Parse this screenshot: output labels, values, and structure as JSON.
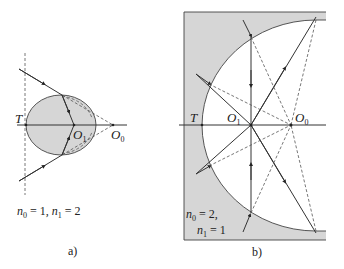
{
  "figure": {
    "panel_a": {
      "caption": "a)",
      "labels": {
        "T": "T",
        "O1": "O",
        "O1_sub": "1",
        "O0": "O",
        "O0_sub": "0"
      },
      "condition": {
        "n0": "n",
        "n0_sub": "0",
        "n0_val": " = 1, ",
        "n1": "n",
        "n1_sub": "1",
        "n1_val": " = 2"
      },
      "medium_fill": "#d6d6d6"
    },
    "panel_b": {
      "caption": "b)",
      "labels": {
        "T": "T",
        "O1": "O",
        "O1_sub": "1",
        "O0": "O",
        "O0_sub": "0"
      },
      "condition_line1": {
        "n0": "n",
        "n0_sub": "0",
        "n0_val": " = 2,"
      },
      "condition_line2": {
        "n1": "n",
        "n1_sub": "1",
        "n1_val": " = 1"
      },
      "medium_fill": "#d6d6d6"
    },
    "colors": {
      "line": "#333333",
      "dashed": "#555555",
      "fill": "#d6d6d6"
    }
  }
}
